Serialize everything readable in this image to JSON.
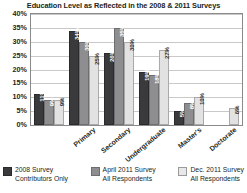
{
  "chart_data": {
    "type": "bar",
    "title": "Education Level as Reflected in the 2008 & 2011 Surveys",
    "xlabel": "",
    "ylabel": "",
    "ylim": [
      0,
      40
    ],
    "ytick_labels": [
      "40%",
      "35%",
      "30%",
      "25%",
      "20%",
      "15%",
      "10%",
      "5%",
      "0%"
    ],
    "ytick_values": [
      40,
      35,
      30,
      25,
      20,
      15,
      10,
      5,
      0
    ],
    "grid": true,
    "legend_position": "bottom",
    "categories": [
      "Primary",
      "Secondary",
      "Undergraduate",
      "Master's",
      "Doctorate",
      "Other"
    ],
    "series": [
      {
        "name": "2008 Survey Contributors Only",
        "color": "#3a3a3c",
        "values": [
          11,
          34,
          26,
          19,
          5,
          0
        ],
        "labels": [
          "11%",
          "34%",
          "26%",
          "19%",
          "5%",
          ""
        ]
      },
      {
        "name": "April 2011 Survey All Respondents",
        "color": "#8e8e90",
        "values": [
          9,
          30,
          35,
          18,
          8,
          0
        ],
        "labels": [
          "9%",
          "30%",
          "35%",
          "18%",
          "8%",
          ""
        ]
      },
      {
        "name": "Dec. 2011 Survey All Respondents",
        "color": "#e2e2e2",
        "values": [
          9,
          25,
          30,
          27,
          10,
          6
        ],
        "labels": [
          "9%",
          "25%",
          "30%",
          "27%",
          "10%",
          "6%"
        ]
      }
    ]
  },
  "legend": [
    {
      "line1": "2008 Survey",
      "line2": "Contributors Only"
    },
    {
      "line1": "April 2011 Survey",
      "line2": "All Respondents"
    },
    {
      "line1": "Dec. 2011 Survey",
      "line2": "All Respondents"
    }
  ]
}
